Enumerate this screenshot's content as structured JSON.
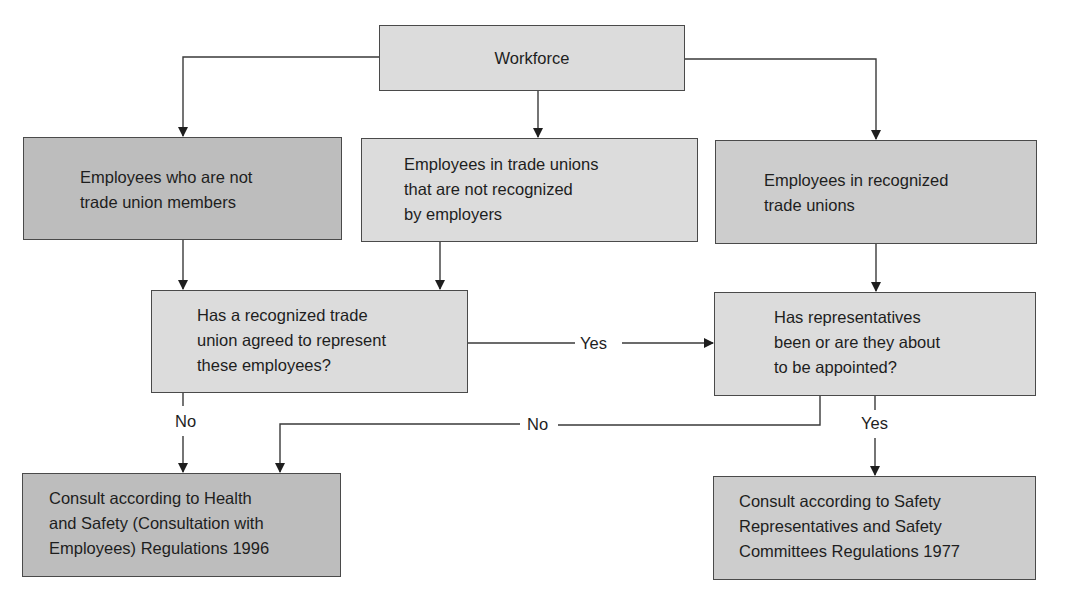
{
  "diagram": {
    "type": "flowchart",
    "colors": {
      "light_fill": "#dcdcdc",
      "mid_fill": "#cdcdcd",
      "dark_fill": "#bdbdbd",
      "line": "#3a3a3a"
    },
    "nodes": {
      "workforce": {
        "label": "Workforce"
      },
      "non_members": {
        "label": "Employees who are not\ntrade union members"
      },
      "unrecognized_unions": {
        "label": "Employees in trade unions\nthat are not recognized\nby employers"
      },
      "recognized_unions": {
        "label": "Employees in recognized\ntrade unions"
      },
      "question_union_agreed": {
        "label": "Has a recognized trade\nunion agreed to represent\nthese employees?"
      },
      "question_representatives": {
        "label": "Has representatives\nbeen or are they about\nto be appointed?"
      },
      "outcome_1996": {
        "label": "Consult according to Health\nand Safety (Consultation with\nEmployees) Regulations 1996"
      },
      "outcome_1977": {
        "label": "Consult according to Safety\nRepresentatives and Safety\nCommittees Regulations 1977"
      }
    },
    "edge_labels": {
      "q1_yes": "Yes",
      "q1_no": "No",
      "q2_no": "No",
      "q2_yes": "Yes"
    },
    "edges": [
      {
        "from": "workforce",
        "to": "non_members"
      },
      {
        "from": "workforce",
        "to": "unrecognized_unions"
      },
      {
        "from": "workforce",
        "to": "recognized_unions"
      },
      {
        "from": "non_members",
        "to": "question_union_agreed"
      },
      {
        "from": "unrecognized_unions",
        "to": "question_union_agreed"
      },
      {
        "from": "recognized_unions",
        "to": "question_representatives"
      },
      {
        "from": "question_union_agreed",
        "to": "question_representatives",
        "label": "Yes"
      },
      {
        "from": "question_union_agreed",
        "to": "outcome_1996",
        "label": "No"
      },
      {
        "from": "question_representatives",
        "to": "outcome_1996",
        "label": "No"
      },
      {
        "from": "question_representatives",
        "to": "outcome_1977",
        "label": "Yes"
      }
    ]
  }
}
